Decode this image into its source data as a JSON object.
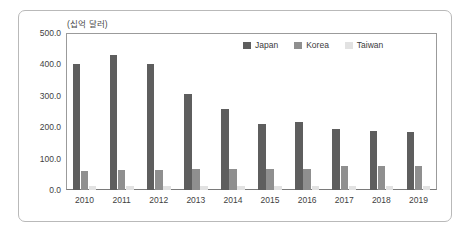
{
  "chart_data": {
    "type": "bar",
    "title": "",
    "subtitle": "",
    "unit_label": "(십억 달러)",
    "xlabel": "",
    "ylabel": "",
    "categories": [
      "2010",
      "2011",
      "2012",
      "2013",
      "2014",
      "2015",
      "2016",
      "2017",
      "2018",
      "2019"
    ],
    "series": [
      {
        "name": "Japan",
        "color": "#5e5e5e",
        "values": [
          400,
          430,
          400,
          305,
          258,
          210,
          215,
          195,
          188,
          185
        ]
      },
      {
        "name": "Korea",
        "color": "#8f8f8f",
        "values": [
          62,
          65,
          64,
          68,
          68,
          66,
          66,
          76,
          77,
          78
        ]
      },
      {
        "name": "Taiwan",
        "color": "#e2e2e2",
        "values": [
          13,
          13,
          13,
          13,
          13,
          13,
          13,
          14,
          14,
          14
        ]
      }
    ],
    "ylim": [
      0,
      500
    ],
    "yticks": [
      "0.0",
      "100.0",
      "200.0",
      "300.0",
      "400.0",
      "500.0"
    ],
    "ytick_values": [
      0,
      100,
      200,
      300,
      400,
      500
    ],
    "grid": false,
    "legend_position": "top-right",
    "legend": [
      "Japan",
      "Korea",
      "Taiwan"
    ]
  },
  "figure": {
    "frame_border_color": "#b9b9b9",
    "axis_color": "#9b9b9b",
    "text_color": "#3f3f3f",
    "background": "#ffffff"
  }
}
